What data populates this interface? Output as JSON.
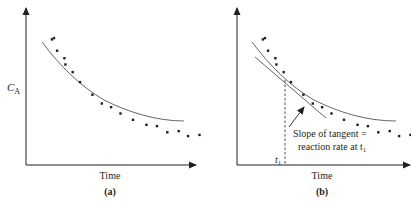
{
  "figure": {
    "panels": [
      {
        "id": "a",
        "caption": "(a)",
        "xlabel": "Time",
        "ylabel": "C",
        "ylabel_sub": "A"
      },
      {
        "id": "b",
        "caption": "(b)",
        "xlabel": "Time",
        "ylabel": "",
        "annotation_line1": "Slope of tangent =",
        "annotation_line2": "reaction rate at t",
        "annotation_sub": "1",
        "tick_label": "t",
        "tick_sub": "1"
      }
    ]
  },
  "chart_data": [
    {
      "type": "scatter",
      "title": "(a)",
      "xlabel": "Time",
      "ylabel": "C_A",
      "grid": false,
      "note": "Concentration of A vs time: experimental points with smooth fitted curve (no numeric ticks)",
      "series": [
        {
          "name": "data points",
          "x": [
            1.0,
            1.2,
            1.5,
            2.2,
            2.3,
            3.0,
            3.7,
            4.9,
            5.8,
            6.7,
            7.6,
            8.8,
            10.1,
            11.1,
            12.1,
            13.2,
            14.1,
            15.2
          ],
          "y": [
            10.0,
            10.1,
            9.1,
            8.5,
            8.0,
            7.4,
            6.6,
            5.6,
            4.9,
            4.6,
            4.1,
            3.6,
            3.2,
            3.1,
            2.6,
            2.7,
            2.3,
            2.4
          ]
        },
        {
          "name": "fitted curve",
          "style": "line"
        }
      ],
      "ylim": [
        0,
        12.5
      ],
      "xlim": [
        0,
        17
      ]
    },
    {
      "type": "scatter",
      "title": "(b)",
      "xlabel": "Time",
      "ylabel": "",
      "grid": false,
      "note": "Same C_A vs time data with tangent line drawn at t1; slope of tangent = reaction rate at t1",
      "series": [
        {
          "name": "data points",
          "x": [
            1.0,
            1.2,
            1.5,
            2.2,
            2.3,
            3.0,
            3.7,
            4.9,
            5.8,
            6.7,
            7.6,
            8.8,
            10.1,
            11.1,
            12.1,
            13.2,
            14.1,
            15.2
          ],
          "y": [
            10.0,
            10.1,
            9.1,
            8.5,
            8.0,
            7.4,
            6.6,
            5.6,
            4.9,
            4.6,
            4.1,
            3.6,
            3.2,
            3.1,
            2.6,
            2.7,
            2.3,
            2.4
          ]
        },
        {
          "name": "fitted curve",
          "style": "line"
        },
        {
          "name": "tangent at t1",
          "style": "line"
        }
      ],
      "annotations": [
        "t1",
        "Slope of tangent = reaction rate at t1"
      ],
      "ylim": [
        0,
        12.5
      ],
      "xlim": [
        0,
        17
      ]
    }
  ]
}
